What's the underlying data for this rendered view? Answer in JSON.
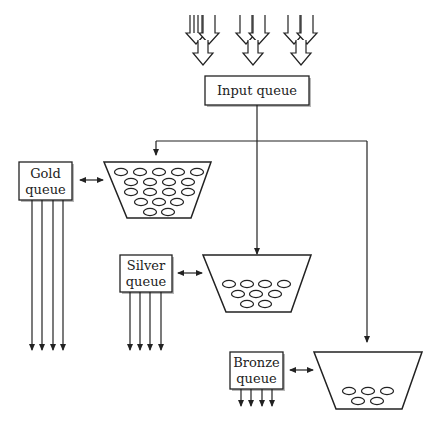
{
  "diagram": {
    "type": "queue-flow",
    "nodes": {
      "input_queue": {
        "label": "Input queue"
      },
      "gold_queue": {
        "label_line1": "Gold",
        "label_line2": "queue",
        "bucket_items": 18,
        "output_arrows": 4
      },
      "silver_queue": {
        "label_line1": "Silver",
        "label_line2": "queue",
        "bucket_items": 9,
        "output_arrows": 4
      },
      "bronze_queue": {
        "label_line1": "Bronze",
        "label_line2": "queue",
        "bucket_items": 5,
        "output_arrows": 4
      }
    },
    "incoming_arrow_groups": 3,
    "edges": [
      {
        "from": "incoming",
        "to": "input_queue"
      },
      {
        "from": "input_queue",
        "to": "gold_bucket"
      },
      {
        "from": "input_queue",
        "to": "silver_bucket"
      },
      {
        "from": "input_queue",
        "to": "bronze_bucket"
      },
      {
        "from": "gold_queue",
        "to": "gold_bucket",
        "bidirectional": true
      },
      {
        "from": "silver_queue",
        "to": "silver_bucket",
        "bidirectional": true
      },
      {
        "from": "bronze_queue",
        "to": "bronze_bucket",
        "bidirectional": true
      }
    ]
  }
}
